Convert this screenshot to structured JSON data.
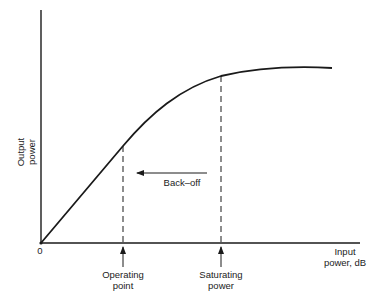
{
  "diagram": {
    "y_axis_label_line1": "Output",
    "y_axis_label_line2": "power",
    "x_axis_label_line1": "Input",
    "x_axis_label_line2": "power, dB",
    "origin_label": "0",
    "operating_point_line1": "Operating",
    "operating_point_line2": "point",
    "saturating_power_line1": "Saturating",
    "saturating_power_line2": "power",
    "backoff_label": "Back–off"
  },
  "colors": {
    "line": "#1a1a1a",
    "background": "#ffffff"
  }
}
